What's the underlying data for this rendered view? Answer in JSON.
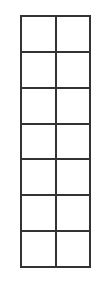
{
  "figure": {
    "kind": "empty-grid",
    "background_color": "#ffffff",
    "line_color": "#333333",
    "line_width_px": 2,
    "rows": 7,
    "columns": 2,
    "total_cells": 14,
    "bounds": {
      "left_px": 20,
      "top_px": 15,
      "width_px": 71,
      "height_px": 253
    },
    "cell_size": {
      "width_px": 35,
      "height_px": 36
    }
  },
  "chart_data": {
    "type": "table",
    "title": "",
    "xlabel": "",
    "ylabel": "",
    "grid": true,
    "legend": "none",
    "columns": [
      "",
      ""
    ],
    "rows": [
      [
        "",
        ""
      ],
      [
        "",
        ""
      ],
      [
        "",
        ""
      ],
      [
        "",
        ""
      ],
      [
        "",
        ""
      ],
      [
        "",
        ""
      ],
      [
        "",
        ""
      ]
    ]
  }
}
